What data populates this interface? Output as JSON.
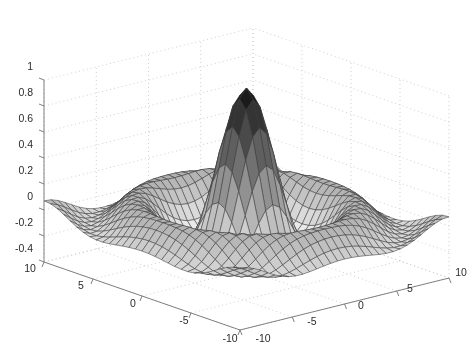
{
  "figure": {
    "title": "",
    "background": "#ffffff",
    "mesh_line_color": "#3c3c3c",
    "face_color_low": "#f2f2f2",
    "face_color_high": "#141414",
    "axis_line_color": "#808080",
    "grid_color": "#d0d0d0",
    "tick_text_color": "#2b2b2b"
  },
  "chart_data": {
    "type": "surface",
    "title": "",
    "xlabel": "",
    "ylabel": "",
    "zlabel": "",
    "function": "sin(r)/r  where r = sqrt(x^2 + y^2)",
    "xlim": [
      -10,
      10
    ],
    "ylim": [
      -10,
      10
    ],
    "zlim": [
      -0.4,
      1
    ],
    "grid": true,
    "legend": "none",
    "colormap": "gray",
    "shading": "faceted",
    "mesh_resolution": 31,
    "view": {
      "azimuth": -37.5,
      "elevation": 30
    },
    "x_axis": {
      "name": "x-axis-front-left",
      "ticks": [
        10,
        5,
        0,
        -5,
        -10
      ],
      "ticklabels": [
        "10",
        "5",
        "0",
        "-5",
        "-10"
      ]
    },
    "y_axis": {
      "name": "y-axis-front-right",
      "ticks": [
        -10,
        -5,
        0,
        5,
        10
      ],
      "ticklabels": [
        "-10",
        "-5",
        "0",
        "5",
        "10"
      ]
    },
    "z_axis": {
      "name": "z-axis-vertical",
      "ticks": [
        1,
        0.8,
        0.6,
        0.4,
        0.2,
        0,
        -0.2,
        -0.4
      ],
      "ticklabels": [
        "1",
        "0.8",
        "0.6",
        "0.4",
        "0.2",
        "0",
        "-0.2",
        "-0.4"
      ]
    },
    "peak_value": 1,
    "min_value": -0.22,
    "ring_extrema": [
      {
        "radius": 0.0,
        "z": 1.0
      },
      {
        "radius": 4.49,
        "z": -0.217
      },
      {
        "radius": 7.73,
        "z": 0.128
      },
      {
        "radius": 10.9,
        "z": -0.091
      }
    ]
  },
  "axis_tick_labels": {
    "z": [
      {
        "text": "1",
        "x": 33,
        "y": 66
      },
      {
        "text": "0.8",
        "x": 33,
        "y": 92
      },
      {
        "text": "0.6",
        "x": 33,
        "y": 118
      },
      {
        "text": "0.4",
        "x": 33,
        "y": 144
      },
      {
        "text": "0.2",
        "x": 33,
        "y": 170
      },
      {
        "text": "0",
        "x": 33,
        "y": 196
      },
      {
        "text": "-0.2",
        "x": 33,
        "y": 222
      },
      {
        "text": "-0.4",
        "x": 33,
        "y": 248
      }
    ],
    "x": [
      {
        "text": "10",
        "x": 30,
        "y": 268
      },
      {
        "text": "5",
        "x": 81,
        "y": 285
      },
      {
        "text": "0",
        "x": 133,
        "y": 303
      },
      {
        "text": "-5",
        "x": 184,
        "y": 320
      },
      {
        "text": "-10",
        "x": 230,
        "y": 338
      }
    ],
    "y": [
      {
        "text": "-10",
        "x": 263,
        "y": 338
      },
      {
        "text": "-5",
        "x": 312,
        "y": 321
      },
      {
        "text": "0",
        "x": 361,
        "y": 305
      },
      {
        "text": "5",
        "x": 410,
        "y": 288
      },
      {
        "text": "10",
        "x": 461,
        "y": 272
      }
    ]
  }
}
